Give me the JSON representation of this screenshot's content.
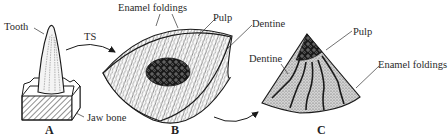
{
  "figure": {
    "panels": [
      {
        "id": "A",
        "caption": "A",
        "labels": [
          "Tooth",
          "Jaw bone"
        ]
      },
      {
        "id": "B",
        "caption": "B",
        "labels": [
          "Enamel foldings",
          "Pulp",
          "Dentine"
        ]
      },
      {
        "id": "C",
        "caption": "C",
        "labels": [
          "Dentine",
          "Pulp",
          "Enamel foldings"
        ]
      }
    ],
    "arrow_label": "TS"
  },
  "labels": {
    "tooth": "Tooth",
    "jaw_bone": "Jaw bone",
    "ts": "TS",
    "b_enamel": "Enamel foldings",
    "b_pulp": "Pulp",
    "b_dentine": "Dentine",
    "c_dentine": "Dentine",
    "c_pulp": "Pulp",
    "c_enamel": "Enamel foldings"
  },
  "captions": {
    "a": "A",
    "b": "B",
    "c": "C"
  },
  "colors": {
    "ink": "#1a1a1a",
    "label": "#2a2a2a",
    "background": "#ffffff",
    "stipple": "#8a8a8a"
  }
}
